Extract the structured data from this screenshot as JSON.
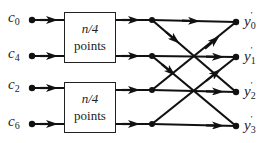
{
  "diagram": {
    "type": "FFT butterfly network",
    "inputs": [
      {
        "name": "c",
        "sub": "0"
      },
      {
        "name": "c",
        "sub": "4"
      },
      {
        "name": "c",
        "sub": "2"
      },
      {
        "name": "c",
        "sub": "6"
      }
    ],
    "boxes": [
      {
        "line1": "n/4",
        "line2": "points"
      },
      {
        "line1": "n/4",
        "line2": "points"
      }
    ],
    "outputs": [
      {
        "name": "y",
        "sub": "0",
        "prime": "'"
      },
      {
        "name": "y",
        "sub": "1",
        "prime": "'"
      },
      {
        "name": "y",
        "sub": "2",
        "prime": "'"
      },
      {
        "name": "y",
        "sub": "3",
        "prime": "'"
      }
    ],
    "edges": [
      {
        "from": "m0",
        "to": "y0"
      },
      {
        "from": "m0",
        "to": "y2"
      },
      {
        "from": "m1",
        "to": "y1"
      },
      {
        "from": "m1",
        "to": "y3"
      },
      {
        "from": "m2",
        "to": "y2"
      },
      {
        "from": "m2",
        "to": "y0"
      },
      {
        "from": "m3",
        "to": "y3"
      },
      {
        "from": "m3",
        "to": "y1"
      }
    ],
    "line_color": "#111111"
  }
}
